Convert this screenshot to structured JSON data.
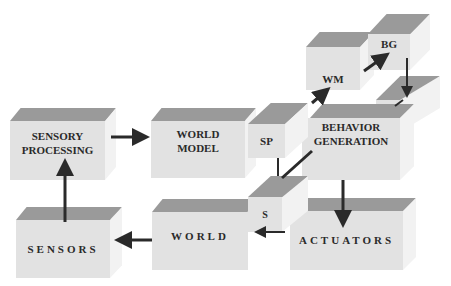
{
  "diagram": {
    "boxes": [
      {
        "id": "sensory-processing",
        "label": "SENSORY PROCESSING",
        "line1": "SENSORY",
        "line2": "PROCESSING"
      },
      {
        "id": "world-model",
        "label": "WORLD MODEL",
        "line1": "WORLD",
        "line2": "MODEL"
      },
      {
        "id": "sp",
        "label": "SP"
      },
      {
        "id": "behavior-generation",
        "label": "BEHAVIOR GENERATION",
        "line1": "BEHAVIOR",
        "line2": "GENERATION"
      },
      {
        "id": "wm",
        "label": "WM"
      },
      {
        "id": "bg",
        "label": "BG"
      },
      {
        "id": "a",
        "label": "A"
      },
      {
        "id": "sensors",
        "label": "SENSORS"
      },
      {
        "id": "world",
        "label": "WORLD"
      },
      {
        "id": "s",
        "label": "S"
      },
      {
        "id": "actuators",
        "label": "ACTUATORS"
      }
    ],
    "edges": [
      {
        "from": "sensors",
        "to": "sensory-processing"
      },
      {
        "from": "sensory-processing",
        "to": "world-model"
      },
      {
        "from": "behavior-generation",
        "to": "wm"
      },
      {
        "from": "wm",
        "to": "bg"
      },
      {
        "from": "bg",
        "to": "a"
      },
      {
        "from": "behavior-generation",
        "to": "actuators"
      },
      {
        "from": "world",
        "to": "sensors"
      },
      {
        "from": "sp",
        "to": "s"
      },
      {
        "from": "s",
        "to": "world"
      }
    ],
    "colors": {
      "top_face": "#9a9a9a",
      "front_face": "#e2e2e2",
      "side_face": "#f2f2f2",
      "arrow": "#2a2a2a"
    }
  }
}
